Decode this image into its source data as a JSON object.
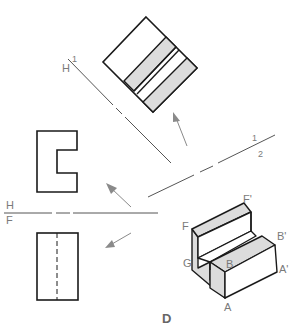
{
  "colors": {
    "outline": "#1a1a1a",
    "fold_line": "#555555",
    "arrow": "#8a8a8a",
    "shade": "#dcdcdc",
    "label": "#7a7a7a"
  },
  "fold_lines": {
    "h1": {
      "top": "H",
      "bottom": "1"
    },
    "one_two": {
      "top": "1",
      "bottom": "2"
    },
    "hf": {
      "top": "H",
      "bottom": "F"
    }
  },
  "isometric_labels": {
    "F": "F",
    "F_prime": "F'",
    "B": "B",
    "B_prime": "B'",
    "G": "G",
    "A": "A",
    "A_prime": "A'"
  },
  "caption": "D"
}
